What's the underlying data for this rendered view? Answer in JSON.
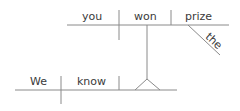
{
  "diagram": {
    "type": "sentence-diagram",
    "sentence": "We know you won the prize",
    "line_color": "#8a8a8a",
    "text_color": "#3a3a3a",
    "main_clause": {
      "subject": "We",
      "verb": "know"
    },
    "noun_clause": {
      "subject": "you",
      "verb": "won",
      "object": "prize",
      "modifier": "the"
    }
  }
}
